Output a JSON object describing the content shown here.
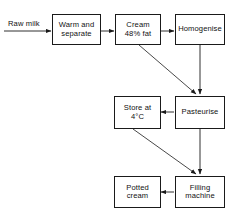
{
  "diagram": {
    "stroke_color": "#1a1a1a",
    "text_color": "#111111",
    "background_color": "#ffffff",
    "input_label": "Raw milk",
    "nodes": [
      {
        "id": "warm-and-separate",
        "label": "Warm and\nseparate"
      },
      {
        "id": "cream-48-fat",
        "label": "Cream\n48% fat"
      },
      {
        "id": "homogenise",
        "label": "Homogenise"
      },
      {
        "id": "store-at-4c",
        "label": "Store at\n4°C"
      },
      {
        "id": "pasteurise",
        "label": "Pasteurise"
      },
      {
        "id": "potted-cream",
        "label": "Potted\ncream"
      },
      {
        "id": "filling-machine",
        "label": "Filling\nmachine"
      }
    ],
    "edges": [
      {
        "from": "raw-milk-input",
        "to": "warm-and-separate"
      },
      {
        "from": "warm-and-separate",
        "to": "cream-48-fat"
      },
      {
        "from": "cream-48-fat",
        "to": "homogenise"
      },
      {
        "from": "cream-48-fat",
        "to": "pasteurise"
      },
      {
        "from": "homogenise",
        "to": "pasteurise"
      },
      {
        "from": "pasteurise",
        "to": "store-at-4c"
      },
      {
        "from": "pasteurise",
        "to": "filling-machine"
      },
      {
        "from": "store-at-4c",
        "to": "filling-machine"
      },
      {
        "from": "filling-machine",
        "to": "potted-cream"
      }
    ]
  }
}
